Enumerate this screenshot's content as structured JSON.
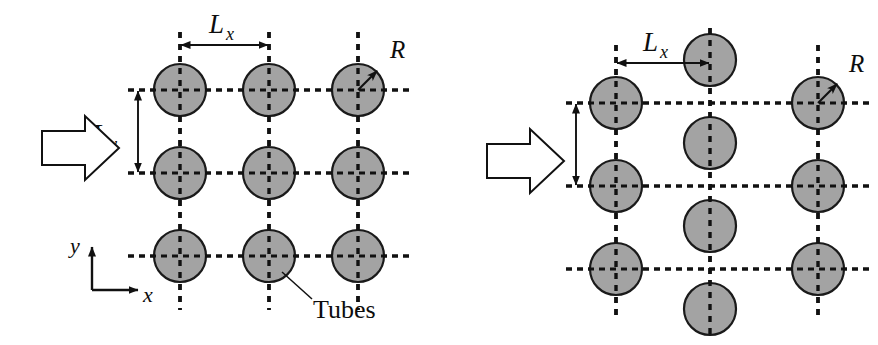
{
  "figure": {
    "background_color": "#ffffff",
    "width": 878,
    "height": 345,
    "tube_fill_color": "#a3a3a3",
    "tube_stroke_color": "#1a1a1a",
    "line_color": "#111111"
  },
  "labels": {
    "lx": "L",
    "lx_sub": "x",
    "ly": "L",
    "ly_sub": "y",
    "radius": "R",
    "axis_x": "x",
    "axis_y": "y",
    "tubes": "Tubes"
  },
  "panels": [
    {
      "id": "inline",
      "name": "inline-arrangement",
      "arrangement": "inline",
      "columns": 3,
      "rows": 3,
      "tube_radius_px": 26,
      "pitch_x_px": 89,
      "pitch_y_px": 83,
      "column_x": [
        180,
        269,
        358
      ],
      "row_y": [
        90,
        173,
        256
      ],
      "has_flow_arrow": true,
      "has_axes": true,
      "has_tubes_callout": true,
      "dimension_lx": {
        "from_x": 180,
        "to_x": 269,
        "y": 45
      },
      "dimension_ly": {
        "x": 138,
        "from_y": 90,
        "to_y": 173
      },
      "radius_marker": {
        "cx": 358,
        "cy": 90,
        "label_x": 398,
        "label_y": 50
      }
    },
    {
      "id": "staggered",
      "name": "staggered-arrangement",
      "arrangement": "staggered",
      "columns": 3,
      "rows": 3,
      "tube_radius_px": 26,
      "pitch_x_px": 97,
      "pitch_y_px": 83,
      "column_x": [
        616,
        710,
        818
      ],
      "row_y": [
        103,
        186,
        269
      ],
      "middle_column_y": [
        60,
        143,
        226,
        309
      ],
      "has_flow_arrow": true,
      "has_axes": false,
      "has_tubes_callout": false,
      "dimension_lx": {
        "from_x": 616,
        "to_x": 710,
        "y": 63
      },
      "dimension_ly": {
        "x": 576,
        "from_y": 103,
        "to_y": 186
      },
      "radius_marker": {
        "cx": 818,
        "cy": 103,
        "label_x": 856,
        "label_y": 64
      }
    }
  ],
  "flow_arrows": [
    {
      "name": "flow-arrow-inline",
      "x": 42,
      "y": 147,
      "direction": "right"
    },
    {
      "name": "flow-arrow-staggered",
      "x": 487,
      "y": 160,
      "direction": "right"
    }
  ],
  "axes": {
    "origin_x": 92,
    "origin_y": 290,
    "x_end": 145,
    "y_end": 243,
    "label_x_pos": {
      "x": 148,
      "y": 300
    },
    "label_y_pos": {
      "x": 72,
      "y": 253
    }
  },
  "tubes_callout": {
    "leader_from": {
      "x": 283,
      "y": 272
    },
    "leader_to": {
      "x": 313,
      "y": 300
    },
    "label_pos": {
      "x": 316,
      "y": 315
    }
  }
}
